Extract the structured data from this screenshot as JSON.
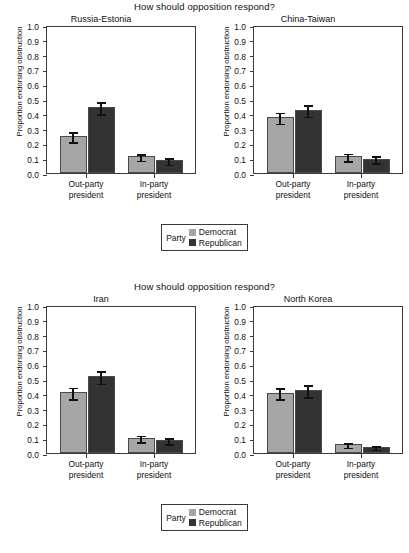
{
  "figure": {
    "width": 409,
    "height": 553,
    "colors": {
      "democrat": "#a6a6a6",
      "republican": "#333333",
      "axis": "#3a3a3a",
      "background": "#ffffff"
    }
  },
  "blocks": [
    {
      "header": "How should opposition respond?",
      "panels": [
        "Russia-Estonia",
        "China-Taiwan"
      ],
      "legend": {
        "title": "Party",
        "items": [
          {
            "label": "Democrat",
            "color": "#a6a6a6"
          },
          {
            "label": "Republican",
            "color": "#333333"
          }
        ]
      }
    },
    {
      "header": "How should opposition respond?",
      "panels": [
        "Iran",
        "North Korea"
      ],
      "legend": {
        "title": "Party",
        "items": [
          {
            "label": "Democrat",
            "color": "#a6a6a6"
          },
          {
            "label": "Republican",
            "color": "#333333"
          }
        ]
      }
    }
  ],
  "axis": {
    "ylabel": "Proportion endorsing obstruction",
    "yticks": [
      "0.0",
      "0.1",
      "0.2",
      "0.3",
      "0.4",
      "0.5",
      "0.6",
      "0.7",
      "0.8",
      "0.9",
      "1.0"
    ],
    "ylim": [
      0,
      1.0
    ],
    "xticks": [
      "Out-party president",
      "In-party president"
    ],
    "xtick_lines": [
      [
        "Out-party",
        "president"
      ],
      [
        "In-party",
        "president"
      ]
    ]
  },
  "chart_data": {
    "type": "bar",
    "title": "How should opposition respond?",
    "xlabel": "",
    "ylabel": "Proportion endorsing obstruction",
    "ylim": [
      0,
      1.0
    ],
    "grid": false,
    "legend_position": "bottom-center",
    "legend_title": "Party",
    "categories": [
      "Out-party president",
      "In-party president"
    ],
    "error_bars": "95% confidence interval",
    "panels": [
      {
        "name": "Russia-Estonia",
        "series": [
          {
            "name": "Democrat",
            "values": [
              0.25,
              0.113
            ],
            "ci_low": [
              0.21,
              0.085
            ],
            "ci_high": [
              0.29,
              0.142
            ]
          },
          {
            "name": "Republican",
            "values": [
              0.445,
              0.088
            ],
            "ci_low": [
              0.398,
              0.06
            ],
            "ci_high": [
              0.492,
              0.115
            ]
          }
        ]
      },
      {
        "name": "China-Taiwan",
        "series": [
          {
            "name": "Democrat",
            "values": [
              0.378,
              0.113
            ],
            "ci_low": [
              0.335,
              0.083
            ],
            "ci_high": [
              0.42,
              0.143
            ]
          },
          {
            "name": "Republican",
            "values": [
              0.428,
              0.098
            ],
            "ci_low": [
              0.383,
              0.07
            ],
            "ci_high": [
              0.472,
              0.128
            ]
          }
        ]
      },
      {
        "name": "Iran",
        "series": [
          {
            "name": "Democrat",
            "values": [
              0.412,
              0.102
            ],
            "ci_low": [
              0.367,
              0.075
            ],
            "ci_high": [
              0.455,
              0.13
            ]
          },
          {
            "name": "Republican",
            "values": [
              0.52,
              0.088
            ],
            "ci_low": [
              0.472,
              0.063
            ],
            "ci_high": [
              0.567,
              0.115
            ]
          }
        ]
      },
      {
        "name": "North Korea",
        "series": [
          {
            "name": "Democrat",
            "values": [
              0.408,
              0.058
            ],
            "ci_low": [
              0.365,
              0.038
            ],
            "ci_high": [
              0.452,
              0.08
            ]
          },
          {
            "name": "Republican",
            "values": [
              0.425,
              0.042
            ],
            "ci_low": [
              0.378,
              0.025
            ],
            "ci_high": [
              0.472,
              0.06
            ]
          }
        ]
      }
    ]
  }
}
